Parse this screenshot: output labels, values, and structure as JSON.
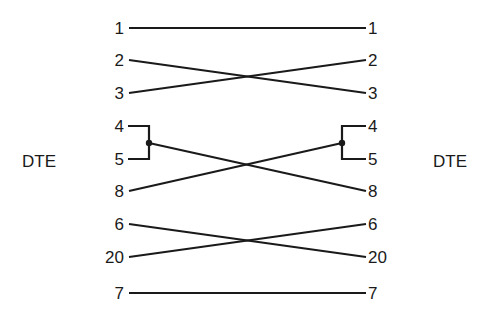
{
  "diagram": {
    "left_device": "DTE",
    "right_device": "DTE",
    "line_color": "#1a1a1a",
    "left_pins": [
      {
        "label": "1",
        "y": 28
      },
      {
        "label": "2",
        "y": 60
      },
      {
        "label": "3",
        "y": 93
      },
      {
        "label": "4",
        "y": 126
      },
      {
        "label": "5",
        "y": 159
      },
      {
        "label": "8",
        "y": 191
      },
      {
        "label": "6",
        "y": 224
      },
      {
        "label": "20",
        "y": 257
      },
      {
        "label": "7",
        "y": 293
      }
    ],
    "right_pins": [
      {
        "label": "1",
        "y": 28
      },
      {
        "label": "2",
        "y": 60
      },
      {
        "label": "3",
        "y": 93
      },
      {
        "label": "4",
        "y": 126
      },
      {
        "label": "5",
        "y": 159
      },
      {
        "label": "8",
        "y": 191
      },
      {
        "label": "6",
        "y": 224
      },
      {
        "label": "20",
        "y": 257
      },
      {
        "label": "7",
        "y": 293
      }
    ],
    "connections": [
      {
        "from": "1",
        "to": "1",
        "type": "straight"
      },
      {
        "from": "2",
        "to": "3",
        "type": "crossed"
      },
      {
        "from": "3",
        "to": "2",
        "type": "crossed"
      },
      {
        "from": "4+5",
        "to": "8",
        "type": "crossed",
        "note": "pins 4 and 5 bridged"
      },
      {
        "from": "8",
        "to": "4+5",
        "type": "crossed",
        "note": "pins 4 and 5 bridged"
      },
      {
        "from": "6",
        "to": "20",
        "type": "crossed"
      },
      {
        "from": "20",
        "to": "6",
        "type": "crossed"
      },
      {
        "from": "7",
        "to": "7",
        "type": "straight"
      }
    ]
  }
}
